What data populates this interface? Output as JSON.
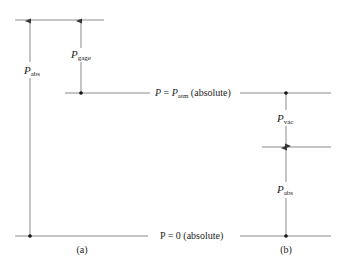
{
  "diagram": {
    "reference_levels": {
      "atmospheric": {
        "symbol": "P",
        "equals": " = ",
        "symbol2": "P",
        "subscript": "atm",
        "suffix": " (absolute)"
      },
      "zero": {
        "text": "P = 0 (absolute)"
      }
    },
    "panel_a": {
      "caption": "(a)",
      "p_abs": {
        "symbol": "P",
        "subscript": "abs"
      },
      "p_gage": {
        "symbol": "P",
        "subscript": "gage"
      }
    },
    "panel_b": {
      "caption": "(b)",
      "p_vac": {
        "symbol": "P",
        "subscript": "vac"
      },
      "p_abs": {
        "symbol": "P",
        "subscript": "abs"
      }
    },
    "colors": {
      "line": "#8a8a8a",
      "arrow": "#555555",
      "dot": "#111111",
      "text": "#222222"
    }
  }
}
